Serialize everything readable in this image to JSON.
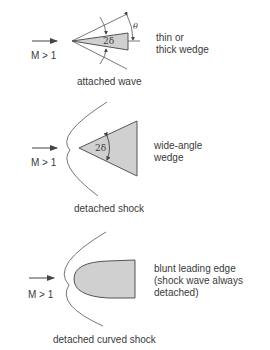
{
  "panels": [
    {
      "id": "attached",
      "mach_label": "M > 1",
      "side_label_line1": "thin or",
      "side_label_line2": "thick wedge",
      "caption": "attached wave",
      "angle_label": "2δ",
      "shock_angle_label": "θ"
    },
    {
      "id": "detached",
      "mach_label": "M > 1",
      "side_label_line1": "wide-angle",
      "side_label_line2": "wedge",
      "caption": "detached shock",
      "angle_label": "2δ"
    },
    {
      "id": "blunt",
      "mach_label": "M > 1",
      "side_label_line1": "blunt leading edge",
      "side_label_line2": "(shock wave always",
      "side_label_line3": "detached)",
      "caption": "detached curved shock"
    }
  ],
  "colors": {
    "body_fill": "#d0d0d0",
    "stroke": "#555555",
    "text": "#3a3a3a"
  }
}
